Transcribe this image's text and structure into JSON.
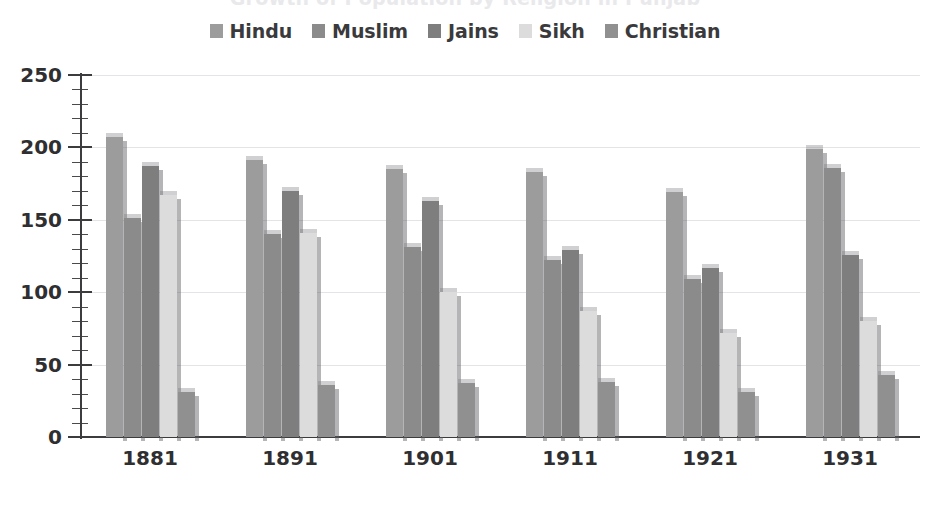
{
  "title": {
    "text": "Growth of Population by Religion in Punjab",
    "clipped": true
  },
  "legend": {
    "position": "top-center",
    "items": [
      {
        "label": "Hindu",
        "color": "#9c9c9c",
        "icon": "legend-swatch"
      },
      {
        "label": "Muslim",
        "color": "#8b8b8b",
        "icon": "legend-swatch"
      },
      {
        "label": "Jains",
        "color": "#7e7e7e",
        "icon": "legend-swatch"
      },
      {
        "label": "Sikh",
        "color": "#dcdcdc",
        "icon": "legend-swatch"
      },
      {
        "label": "Christian",
        "color": "#909090",
        "icon": "legend-swatch"
      }
    ]
  },
  "axes": {
    "y_ticks": [
      "250",
      "200",
      "150",
      "100",
      "50",
      "0"
    ],
    "y_tick_values": [
      250,
      200,
      150,
      100,
      50,
      0
    ],
    "y_minor_step": 10,
    "x_ticks": [
      "1881",
      "1891",
      "1901",
      "1911",
      "1921",
      "1931"
    ]
  },
  "chart_data": {
    "type": "bar",
    "title": "Growth of Population by Religion in Punjab",
    "xlabel": "",
    "ylabel": "",
    "ylim": [
      0,
      250
    ],
    "grid": true,
    "legend_position": "top-center",
    "categories": [
      "1881",
      "1891",
      "1901",
      "1911",
      "1921",
      "1931"
    ],
    "series": [
      {
        "name": "Hindu",
        "color": "#9c9c9c",
        "values": [
          207,
          191,
          185,
          183,
          169,
          199
        ]
      },
      {
        "name": "Muslim",
        "color": "#8b8b8b",
        "values": [
          151,
          140,
          131,
          122,
          109,
          186
        ]
      },
      {
        "name": "Jains",
        "color": "#7e7e7e",
        "values": [
          187,
          170,
          163,
          129,
          117,
          126
        ]
      },
      {
        "name": "Sikh",
        "color": "#dcdcdc",
        "values": [
          167,
          141,
          100,
          87,
          72,
          80
        ]
      },
      {
        "name": "Christian",
        "color": "#909090",
        "values": [
          31,
          36,
          37,
          38,
          31,
          43
        ]
      }
    ]
  }
}
